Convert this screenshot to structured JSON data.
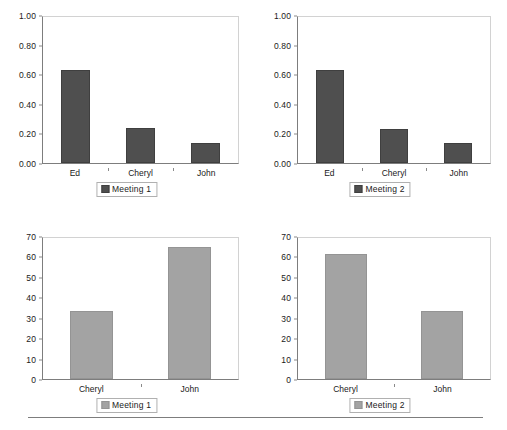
{
  "page": {
    "background_color": "#ffffff",
    "bottom_rule_color": "#7d7d7d"
  },
  "colors": {
    "series_meeting_1_top": "#4f4f4f",
    "series_meeting_2_top": "#4f4f4f",
    "series_meeting_1_bottom": "#a3a3a3",
    "series_meeting_2_bottom": "#a3a3a3",
    "axis": "#7d7d7d",
    "plot_border_light": "#d2d2d2",
    "text": "#1a1a1a"
  },
  "chart_data": [
    {
      "id": "top-left",
      "type": "bar",
      "title": "",
      "xlabel": "",
      "ylabel": "",
      "categories": [
        "Ed",
        "Cheryl",
        "John"
      ],
      "values": [
        0.64,
        0.24,
        0.135
      ],
      "series": [
        {
          "name": "Meeting 1",
          "values": [
            0.64,
            0.24,
            0.135
          ],
          "color": "#4f4f4f"
        }
      ],
      "ylim": [
        0.0,
        1.0
      ],
      "yticks": [
        0.0,
        0.2,
        0.4,
        0.6,
        0.8,
        1.0
      ],
      "ytick_labels": [
        "0.00",
        "0.20",
        "0.40",
        "0.60",
        "0.80",
        "1.00"
      ],
      "legend": {
        "entries": [
          "Meeting 1"
        ],
        "position": "bottom-center"
      },
      "grid": false
    },
    {
      "id": "top-right",
      "type": "bar",
      "title": "",
      "xlabel": "",
      "ylabel": "",
      "categories": [
        "Ed",
        "Cheryl",
        "John"
      ],
      "values": [
        0.64,
        0.235,
        0.135
      ],
      "series": [
        {
          "name": "Meeting 2",
          "values": [
            0.64,
            0.235,
            0.135
          ],
          "color": "#4f4f4f"
        }
      ],
      "ylim": [
        0.0,
        1.0
      ],
      "yticks": [
        0.0,
        0.2,
        0.4,
        0.6,
        0.8,
        1.0
      ],
      "ytick_labels": [
        "0.00",
        "0.20",
        "0.40",
        "0.60",
        "0.80",
        "1.00"
      ],
      "legend": {
        "entries": [
          "Meeting 2"
        ],
        "position": "bottom-center"
      },
      "grid": false
    },
    {
      "id": "bottom-left",
      "type": "bar",
      "title": "",
      "xlabel": "",
      "ylabel": "",
      "categories": [
        "Cheryl",
        "John"
      ],
      "values": [
        34,
        65.5
      ],
      "series": [
        {
          "name": "Meeting 1",
          "values": [
            34,
            65.5
          ],
          "color": "#a3a3a3"
        }
      ],
      "ylim": [
        0,
        70
      ],
      "yticks": [
        0,
        10,
        20,
        30,
        40,
        50,
        60,
        70
      ],
      "ytick_labels": [
        "0",
        "10",
        "20",
        "30",
        "40",
        "50",
        "60",
        "70"
      ],
      "legend": {
        "entries": [
          "Meeting 1"
        ],
        "position": "bottom-center"
      },
      "grid": false
    },
    {
      "id": "bottom-right",
      "type": "bar",
      "title": "",
      "xlabel": "",
      "ylabel": "",
      "categories": [
        "Cheryl",
        "John"
      ],
      "values": [
        62,
        34
      ],
      "series": [
        {
          "name": "Meeting 2",
          "values": [
            62,
            34
          ],
          "color": "#a3a3a3"
        }
      ],
      "ylim": [
        0,
        70
      ],
      "yticks": [
        0,
        10,
        20,
        30,
        40,
        50,
        60,
        70
      ],
      "ytick_labels": [
        "0",
        "10",
        "20",
        "30",
        "40",
        "50",
        "60",
        "70"
      ],
      "legend": {
        "entries": [
          "Meeting 2"
        ],
        "position": "bottom-center"
      },
      "grid": false
    }
  ]
}
